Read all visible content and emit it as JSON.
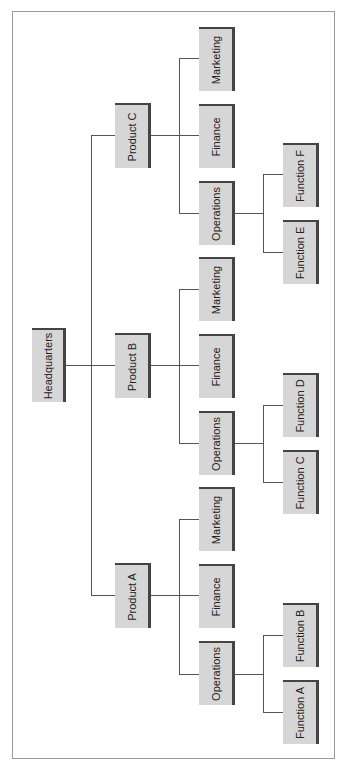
{
  "diagram": {
    "type": "org-chart",
    "orientation": "rotated-90",
    "root": "Headquarters",
    "nodes": {
      "hq": "Headquarters",
      "pa": "Product A",
      "pb": "Product B",
      "pc": "Product C",
      "pa_ops": "Operations",
      "pa_fin": "Finance",
      "pa_mkt": "Marketing",
      "pb_ops": "Operations",
      "pb_fin": "Finance",
      "pb_mkt": "Marketing",
      "pc_ops": "Operations",
      "pc_fin": "Finance",
      "pc_mkt": "Marketing",
      "fa": "Function A",
      "fb": "Function B",
      "fc": "Function C",
      "fd": "Function D",
      "fe": "Function E",
      "ff": "Function F"
    },
    "edges": [
      [
        "Headquarters",
        "Product A"
      ],
      [
        "Headquarters",
        "Product B"
      ],
      [
        "Headquarters",
        "Product C"
      ],
      [
        "Product A",
        "Operations"
      ],
      [
        "Product A",
        "Finance"
      ],
      [
        "Product A",
        "Marketing"
      ],
      [
        "Product B",
        "Operations"
      ],
      [
        "Product B",
        "Finance"
      ],
      [
        "Product B",
        "Marketing"
      ],
      [
        "Product C",
        "Operations"
      ],
      [
        "Product C",
        "Finance"
      ],
      [
        "Product C",
        "Marketing"
      ],
      [
        "Operations (A)",
        "Function A"
      ],
      [
        "Operations (A)",
        "Function B"
      ],
      [
        "Operations (B)",
        "Function C"
      ],
      [
        "Operations (B)",
        "Function D"
      ],
      [
        "Operations (C)",
        "Function E"
      ],
      [
        "Operations (C)",
        "Function F"
      ]
    ]
  }
}
